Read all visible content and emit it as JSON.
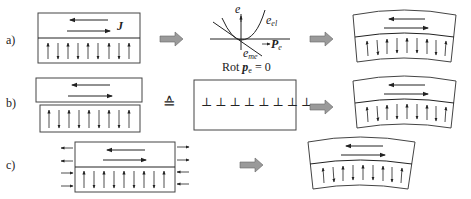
{
  "figure": {
    "rows": [
      {
        "id": "a",
        "label": "a)",
        "current_symbol": "J",
        "graph": {
          "y_axis_label": "e",
          "curve_elastic_label": "e",
          "curve_elastic_sub": "el",
          "curve_me_label": "e",
          "curve_me_sub": "me",
          "x_axis_label": "P",
          "x_axis_sub": "e",
          "caption_prefix": "Rot ",
          "caption_symbol": "p",
          "caption_sub": "e",
          "caption_suffix": " = 0"
        },
        "result": "bent-bilayer"
      },
      {
        "id": "b",
        "label": "b)",
        "equivalence_symbol": "≙",
        "dislocation_symbol": "⊥",
        "dislocation_count": 8,
        "result": "bent-bilayer"
      },
      {
        "id": "c",
        "label": "c)",
        "result": "bent-bilayer"
      }
    ],
    "polarization_arrows": [
      "up",
      "down",
      "up",
      "down",
      "up",
      "down",
      "up",
      "down",
      "up"
    ],
    "colors": {
      "line": "#222222",
      "box_stroke": "#444444",
      "process_arrow_fill": "#9a9a9a"
    }
  }
}
